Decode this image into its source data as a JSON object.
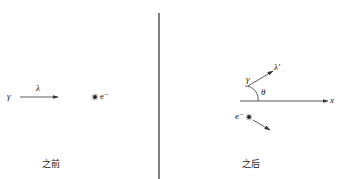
{
  "diagram": {
    "before": {
      "caption": "之前",
      "photon_symbol": "γ",
      "wavelength_symbol": "λ",
      "electron_label": "e⁻"
    },
    "after": {
      "caption": "之后",
      "photon_symbol": "γ",
      "wavelength_symbol": "λ′",
      "angle_symbol": "θ",
      "axis_label": "x",
      "electron_label": "e⁻"
    },
    "colors": {
      "line": "#333333",
      "divider": "#555555",
      "background": "#ffffff"
    }
  }
}
